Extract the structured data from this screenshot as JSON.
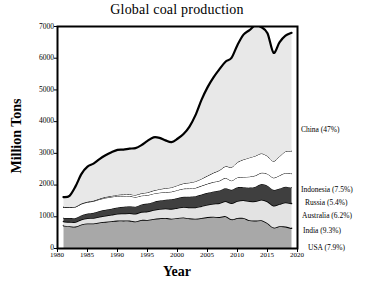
{
  "chart_data": {
    "type": "area",
    "title": "Global coal production",
    "xlabel": "Year",
    "ylabel": "Million Tons",
    "xlim": [
      1980,
      2020
    ],
    "ylim": [
      0,
      7000
    ],
    "xticks": [
      1980,
      1985,
      1990,
      1995,
      2000,
      2005,
      2010,
      2015,
      2020
    ],
    "yticks": [
      0,
      1000,
      2000,
      3000,
      4000,
      5000,
      6000,
      7000
    ],
    "grid": false,
    "stacked": true,
    "legend_position": "right-outside",
    "x": [
      1981,
      1982,
      1983,
      1984,
      1985,
      1986,
      1987,
      1988,
      1989,
      1990,
      1991,
      1992,
      1993,
      1994,
      1995,
      1996,
      1997,
      1998,
      1999,
      2000,
      2001,
      2002,
      2003,
      2004,
      2005,
      2006,
      2007,
      2008,
      2009,
      2010,
      2011,
      2012,
      2013,
      2014,
      2015,
      2016,
      2017,
      2018,
      2019
    ],
    "series": [
      {
        "name": "USA",
        "legend": "USA (7.9%)",
        "color": "#a8a8a8",
        "share_percent": 7.9,
        "values": [
          720,
          700,
          690,
          760,
          790,
          790,
          820,
          840,
          860,
          880,
          880,
          880,
          850,
          900,
          900,
          930,
          950,
          960,
          940,
          960,
          980,
          950,
          940,
          960,
          990,
          1000,
          990,
          1020,
          920,
          960,
          960,
          890,
          880,
          890,
          800,
          660,
          700,
          690,
          640
        ]
      },
      {
        "name": "India",
        "legend": "India (9.3%)",
        "color": "#e3e3e3",
        "share_percent": 9.3,
        "values": [
          130,
          140,
          145,
          155,
          165,
          175,
          185,
          195,
          205,
          215,
          225,
          235,
          245,
          255,
          270,
          285,
          295,
          300,
          310,
          320,
          330,
          345,
          355,
          375,
          390,
          410,
          440,
          470,
          510,
          540,
          560,
          600,
          610,
          650,
          680,
          690,
          700,
          760,
          780
        ]
      },
      {
        "name": "Australia",
        "legend": "Australia (6.2%)",
        "color": "#3f3f3f",
        "share_percent": 6.2,
        "values": [
          110,
          120,
          125,
          135,
          145,
          160,
          175,
          185,
          190,
          200,
          210,
          220,
          225,
          235,
          245,
          255,
          265,
          280,
          300,
          310,
          320,
          340,
          355,
          365,
          375,
          390,
          400,
          410,
          420,
          430,
          410,
          430,
          460,
          490,
          500,
          500,
          490,
          500,
          500
        ]
      },
      {
        "name": "Russia",
        "legend": "Russia (5.4%)",
        "color": "#ffffff",
        "share_percent": 5.4,
        "values": [
          340,
          345,
          350,
          355,
          360,
          365,
          370,
          375,
          370,
          360,
          340,
          320,
          300,
          275,
          265,
          260,
          250,
          235,
          240,
          250,
          255,
          255,
          260,
          275,
          285,
          295,
          305,
          320,
          290,
          310,
          325,
          345,
          350,
          355,
          370,
          380,
          410,
          430,
          440
        ]
      },
      {
        "name": "Indonesia",
        "legend": "Indonesia (7.5%)",
        "color": "#ffffff",
        "share_percent": 7.5,
        "values": [
          5,
          6,
          8,
          10,
          12,
          15,
          20,
          25,
          30,
          35,
          45,
          55,
          65,
          75,
          85,
          95,
          110,
          125,
          135,
          150,
          165,
          185,
          205,
          220,
          250,
          290,
          330,
          370,
          420,
          480,
          550,
          600,
          620,
          610,
          560,
          520,
          600,
          680,
          710
        ]
      },
      {
        "name": "China",
        "legend": "China (47%)",
        "color": "#e8e8e8",
        "share_percent": 47,
        "values": [
          315,
          350,
          640,
          940,
          1110,
          1170,
          1250,
          1320,
          1380,
          1420,
          1420,
          1440,
          1480,
          1520,
          1630,
          1680,
          1620,
          1510,
          1430,
          1470,
          1560,
          1770,
          2090,
          2490,
          2790,
          3010,
          3190,
          3300,
          3450,
          3700,
          3940,
          4020,
          4120,
          3980,
          3880,
          3420,
          3600,
          3650,
          3730
        ]
      }
    ],
    "totals": [
      1620,
      1661,
      1958,
      2355,
      2582,
      2675,
      2820,
      2940,
      3036,
      3110,
      3120,
      3150,
      3165,
      3260,
      3395,
      3505,
      3490,
      3410,
      3355,
      3460,
      3610,
      3845,
      4215,
      4685,
      5080,
      5395,
      5655,
      5890,
      6010,
      6420,
      6745,
      6885,
      7040,
      6975,
      6790,
      6170,
      6500,
      6710,
      6800
    ]
  }
}
